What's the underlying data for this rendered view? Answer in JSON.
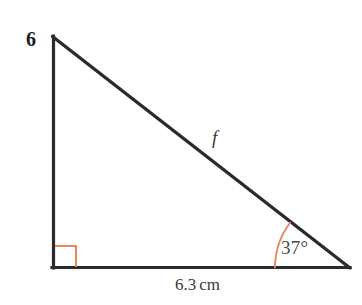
{
  "figure": {
    "number_label": "6",
    "type": "right-triangle-diagram",
    "background_color": "#ffffff",
    "line_color": "#2b2b2b",
    "accent_color": "#e8875a",
    "labels": {
      "hypotenuse": "f",
      "angle": "37°",
      "angle_value": 37,
      "base_value": "6.3",
      "base_unit": "cm",
      "base_full": "6.3 cm"
    },
    "geometry": {
      "apex": [
        52,
        36
      ],
      "bottom_left": [
        52,
        268
      ],
      "bottom_right": [
        349,
        268
      ],
      "right_angle_marker_size": 21,
      "angle_arc_radius": 75
    }
  }
}
